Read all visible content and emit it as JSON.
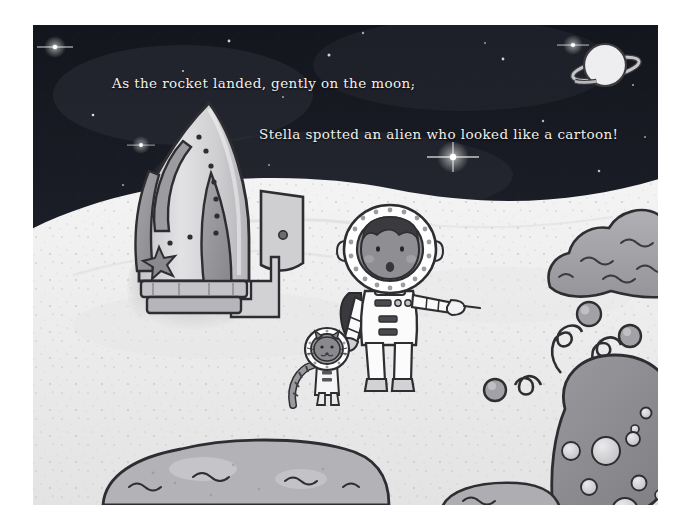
{
  "page": {
    "kind": "storybook-illustration",
    "width": 694,
    "height": 529,
    "paper_color": "#ffffff"
  },
  "story": {
    "line_1": "As the rocket landed, gently on the moon,",
    "line_2": "Stella spotted an alien who looked like a cartoon!",
    "text_color": "#f2f0ea"
  },
  "scene": {
    "title": "Moon landing scene",
    "sky": {
      "name": "night-sky",
      "color_top": "#15171f",
      "color_bottom": "#2a2c35",
      "stars": [
        {
          "x": 22,
          "y": 22,
          "r": 2.6,
          "bright": 1.0
        },
        {
          "x": 60,
          "y": 90,
          "r": 1.4,
          "bright": 0.7
        },
        {
          "x": 108,
          "y": 120,
          "r": 2.2,
          "bright": 0.9
        },
        {
          "x": 150,
          "y": 46,
          "r": 1.2,
          "bright": 0.6
        },
        {
          "x": 196,
          "y": 16,
          "r": 1.5,
          "bright": 0.7
        },
        {
          "x": 250,
          "y": 72,
          "r": 1.1,
          "bright": 0.5
        },
        {
          "x": 296,
          "y": 30,
          "r": 1.6,
          "bright": 0.7
        },
        {
          "x": 342,
          "y": 112,
          "r": 1.3,
          "bright": 0.6
        },
        {
          "x": 380,
          "y": 60,
          "r": 1.2,
          "bright": 0.6
        },
        {
          "x": 420,
          "y": 132,
          "r": 4.0,
          "bright": 1.0
        },
        {
          "x": 470,
          "y": 34,
          "r": 1.5,
          "bright": 0.7
        },
        {
          "x": 510,
          "y": 96,
          "r": 1.3,
          "bright": 0.6
        },
        {
          "x": 540,
          "y": 20,
          "r": 2.8,
          "bright": 1.0
        },
        {
          "x": 566,
          "y": 146,
          "r": 1.4,
          "bright": 0.6
        },
        {
          "x": 600,
          "y": 60,
          "r": 1.2,
          "bright": 0.5
        },
        {
          "x": 90,
          "y": 160,
          "r": 1.2,
          "bright": 0.5
        },
        {
          "x": 236,
          "y": 140,
          "r": 1.1,
          "bright": 0.5
        },
        {
          "x": 452,
          "y": 18,
          "r": 1.1,
          "bright": 0.5
        }
      ]
    },
    "planet": {
      "name": "ringed-planet",
      "label": "Saturn",
      "cx": 572,
      "cy": 40,
      "r": 21,
      "body_color": "#e9e9ea",
      "ring_color": "#b9bbc0"
    },
    "moon_ground": {
      "name": "moon-surface",
      "color": "#ebebeb",
      "speckle_color": "#b6b6b6"
    },
    "rocket": {
      "name": "rocket",
      "body_color": "#d8d8da",
      "fin_color": "#9a9a9e",
      "outline_color": "#3a3a3e",
      "rivet_count": 9,
      "has_window": true,
      "has_star_emblem": true,
      "has_stair_ramp": true,
      "has_exhaust_smoke": true
    },
    "astronaut": {
      "name": "astronaut-stella",
      "label": "Stella",
      "suit_color": "#fbfbfb",
      "helmet_ring_color": "#ffffff",
      "visor_color": "#8e8e92",
      "skin_color": "#8f8f93",
      "hair_color": "#3b3b3f",
      "backpack_color": "#3a3a3e",
      "pose": "pointing-right",
      "helmet_dot_count": 18
    },
    "cat": {
      "name": "astronaut-cat",
      "suit_color": "#f5f5f5",
      "fur_color": "#8a8a8e",
      "helmet_dot_count": 12,
      "has_striped_tail": true
    },
    "alien": {
      "name": "alien-creature",
      "body_color": "#8e8e92",
      "spot_color": "#d4d4d6",
      "outline_color": "#3a3a3e",
      "antenna_count": 3,
      "spot_count": 9,
      "description": "blobby spotted alien with curly antennae"
    },
    "rocks": [
      {
        "name": "rock-right",
        "color": "#9d9da1"
      },
      {
        "name": "rock-bottom-left",
        "color": "#b2b2b6"
      },
      {
        "name": "rock-bottom-right",
        "color": "#a8a8ac"
      }
    ]
  }
}
